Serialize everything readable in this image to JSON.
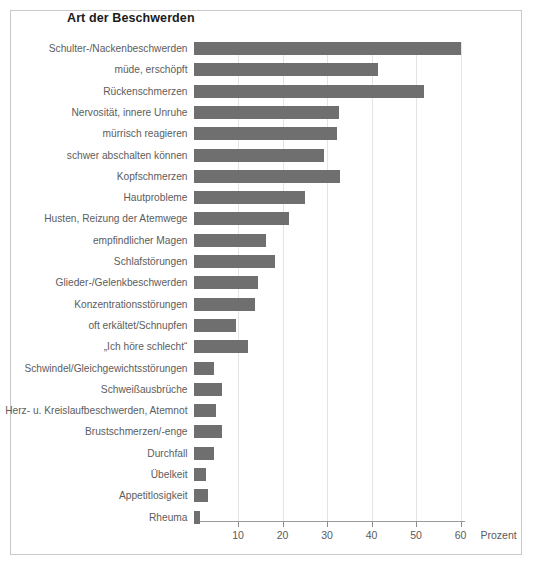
{
  "chart": {
    "title": "Art der Beschwerden",
    "axis_unit_label": "Prozent"
  },
  "chart_data": {
    "type": "bar",
    "orientation": "horizontal",
    "title": "Art der Beschwerden",
    "xlabel": "Prozent",
    "ylabel": "",
    "xlim": [
      0,
      65
    ],
    "grid": true,
    "legend": null,
    "bar_color": "#6f6f6f",
    "tick_labels": [
      "10",
      "20",
      "30",
      "40",
      "50",
      "60"
    ],
    "ticks": [
      10,
      20,
      30,
      40,
      50,
      60
    ],
    "categories": [
      "Schulter-/Nackenbeschwerden",
      "müde, erschöpft",
      "Rückenschmerzen",
      "Nervosität, innere Unruhe",
      "mürrisch reagieren",
      "schwer abschalten können",
      "Kopfschmerzen",
      "Hautprobleme",
      "Husten, Reizung der Atemwege",
      "empfindlicher Magen",
      "Schlafstörungen",
      "Glieder-/Gelenkbeschwerden",
      "Konzentrationsstörungen",
      "oft erkältet/Schnupfen",
      "„Ich höre schlecht“",
      "Schwindel/Gleichgewichtsstörungen",
      "Schweißausbrüche",
      "Herz- u. Kreislaufbeschwerden, Atemnot",
      "Brustschmerzen/-enge",
      "Durchfall",
      "Übelkeit",
      "Appetitlosigkeit",
      "Rheuma"
    ],
    "values": [
      60.0,
      41.5,
      51.8,
      32.8,
      32.2,
      29.3,
      32.9,
      25.0,
      21.4,
      16.2,
      18.3,
      14.5,
      13.8,
      9.6,
      12.3,
      4.5,
      6.3,
      5.0,
      6.4,
      4.5,
      2.8,
      3.3,
      1.5
    ]
  }
}
